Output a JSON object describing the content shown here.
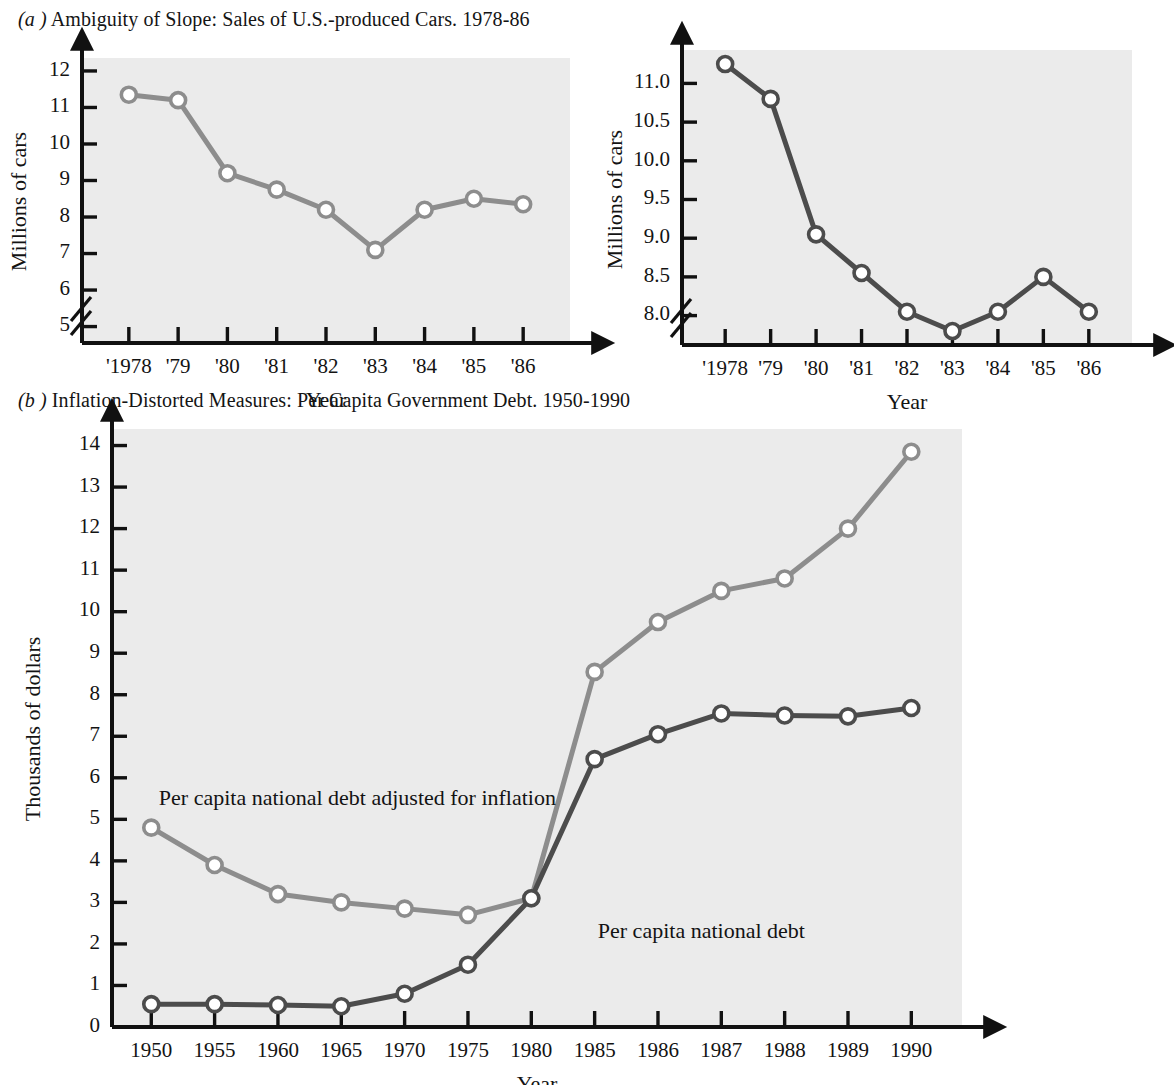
{
  "captions": {
    "a_label": "(a )",
    "a_text": "Ambiguity of Slope: Sales of U.S.-produced Cars. 1978-86",
    "b_label": "(b )",
    "b_text": "Inflation-Distorted Measures: Per Capita Government Debt. 1950-1990"
  },
  "colors": {
    "plot_background": "#ebebeb",
    "axis": "#111111",
    "series_light_gray": "#8d8d8d",
    "series_dark_gray": "#4c4c4c",
    "text": "#131313",
    "marker_fill": "#ffffff"
  },
  "chart_data": [
    {
      "id": "cars-compressed-scale",
      "type": "line",
      "title": "Ambiguity of Slope: Sales of U.S.-produced Cars. 1978-86",
      "xlabel": "Year",
      "ylabel": "Millions of cars",
      "categories": [
        "'1978",
        "'79",
        "'80",
        "'81",
        "'82",
        "'83",
        "'84",
        "'85",
        "'86"
      ],
      "yticks": [
        5,
        6,
        7,
        8,
        9,
        10,
        11,
        12
      ],
      "ytick_labels": [
        "5",
        "6",
        "7",
        "8",
        "9",
        "10",
        "11",
        "12"
      ],
      "ylim": [
        4.55,
        12.3
      ],
      "axis_break": true,
      "grid": false,
      "legend": "none",
      "series": [
        {
          "name": "Millions of cars",
          "color": "#8d8d8d",
          "values": [
            11.35,
            11.2,
            9.2,
            8.75,
            8.2,
            7.1,
            8.2,
            8.5,
            8.35
          ]
        }
      ]
    },
    {
      "id": "cars-expanded-scale",
      "type": "line",
      "title": "Ambiguity of Slope: Sales of U.S.-produced Cars. 1978-86",
      "xlabel": "Year",
      "ylabel": "Millions of cars",
      "categories": [
        "'1978",
        "'79",
        "'80",
        "'81",
        "'82",
        "'83",
        "'84",
        "'85",
        "'86"
      ],
      "yticks": [
        8.0,
        8.5,
        9.0,
        9.5,
        10.0,
        10.5,
        11.0
      ],
      "ytick_labels": [
        "8.0",
        "8.5",
        "9.0",
        "9.5",
        "10.0",
        "10.5",
        "11.0"
      ],
      "ylim": [
        7.62,
        11.38
      ],
      "axis_break": true,
      "grid": false,
      "legend": "none",
      "series": [
        {
          "name": "Millions of cars",
          "color": "#4c4c4c",
          "values": [
            11.25,
            10.8,
            9.05,
            8.55,
            8.05,
            7.8,
            8.05,
            8.5,
            8.05
          ]
        }
      ]
    },
    {
      "id": "per-capita-government-debt",
      "type": "line",
      "title": "Inflation-Distorted Measures: Per Capita Government Debt. 1950-1990",
      "xlabel": "Year",
      "ylabel": "Thousands of dollars",
      "categories": [
        "1950",
        "1955",
        "1960",
        "1965",
        "1970",
        "1975",
        "1980",
        "1985",
        "1986",
        "1987",
        "1988",
        "1989",
        "1990"
      ],
      "yticks": [
        0,
        1,
        2,
        3,
        4,
        5,
        6,
        7,
        8,
        9,
        10,
        11,
        12,
        13,
        14
      ],
      "ytick_labels": [
        "0",
        "1",
        "2",
        "3",
        "4",
        "5",
        "6",
        "7",
        "8",
        "9",
        "10",
        "11",
        "12",
        "13",
        "14"
      ],
      "ylim": [
        0,
        14.35
      ],
      "grid": false,
      "legend": "inline-annotation",
      "annotations": [
        {
          "text": "Per capita national debt adjusted for inflation",
          "x": 0.12,
          "y": 5.35
        },
        {
          "text": "Per capita national debt",
          "x": 7.05,
          "y": 2.15
        }
      ],
      "series": [
        {
          "name": "Per capita national debt adjusted for inflation",
          "color": "#8d8d8d",
          "values": [
            4.8,
            3.9,
            3.2,
            3.0,
            2.85,
            2.7,
            3.1,
            8.55,
            9.75,
            10.5,
            10.8,
            12.0,
            13.85
          ]
        },
        {
          "name": "Per capita national debt",
          "color": "#4c4c4c",
          "values": [
            0.55,
            0.55,
            0.53,
            0.5,
            0.8,
            1.5,
            3.1,
            6.45,
            7.05,
            7.55,
            7.5,
            7.48,
            7.68
          ]
        }
      ]
    }
  ]
}
